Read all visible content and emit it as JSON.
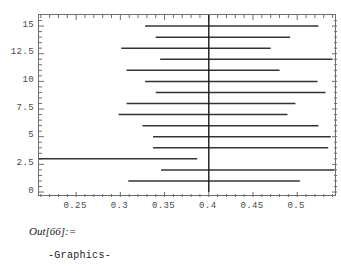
{
  "notebook": {
    "out_prompt": "Out[66]:=",
    "out_value": "-Graphics-"
  },
  "axis": {
    "y_ticks": [
      "0",
      "2.5",
      "5",
      "7.5",
      "10",
      "12.5",
      "15"
    ],
    "x_ticks": [
      "0.25",
      "0.3",
      "0.35",
      "0.4",
      "0.45",
      "0.5"
    ]
  },
  "colors": {
    "frame": "#6e6e6e",
    "tick_text": "#4a4a4a",
    "interval_line": "#333333",
    "reference_line": "#1a1a1a",
    "background": "#ffffff"
  },
  "chart_data": {
    "type": "line",
    "title": "",
    "xlabel": "",
    "ylabel": "",
    "xlim": [
      0.208,
      0.545
    ],
    "ylim": [
      -0.45,
      16.0
    ],
    "grid": false,
    "legend": null,
    "y_ticks": [
      0,
      2.5,
      5,
      7.5,
      10,
      12.5,
      15
    ],
    "x_ticks": [
      0.25,
      0.3,
      0.35,
      0.4,
      0.45,
      0.5
    ],
    "reference_line_x": 0.4,
    "reference_line_y_range": [
      0,
      16
    ],
    "series": [
      {
        "name": "confidence-intervals",
        "orientation": "horizontal",
        "intervals": [
          {
            "y": 15,
            "x_low": 0.328,
            "x_high": 0.524
          },
          {
            "y": 14,
            "x_low": 0.34,
            "x_high": 0.492
          },
          {
            "y": 13,
            "x_low": 0.301,
            "x_high": 0.47
          },
          {
            "y": 12,
            "x_low": 0.345,
            "x_high": 0.54
          },
          {
            "y": 11,
            "x_low": 0.307,
            "x_high": 0.48
          },
          {
            "y": 10,
            "x_low": 0.328,
            "x_high": 0.523
          },
          {
            "y": 9,
            "x_low": 0.34,
            "x_high": 0.532
          },
          {
            "y": 8,
            "x_low": 0.307,
            "x_high": 0.498
          },
          {
            "y": 7,
            "x_low": 0.298,
            "x_high": 0.489
          },
          {
            "y": 6,
            "x_low": 0.325,
            "x_high": 0.524
          },
          {
            "y": 5,
            "x_low": 0.337,
            "x_high": 0.538
          },
          {
            "y": 4,
            "x_low": 0.337,
            "x_high": 0.535
          },
          {
            "y": 3,
            "x_low": 0.199,
            "x_high": 0.387
          },
          {
            "y": 2,
            "x_low": 0.346,
            "x_high": 0.542
          },
          {
            "y": 1,
            "x_low": 0.309,
            "x_high": 0.503
          }
        ]
      }
    ]
  }
}
